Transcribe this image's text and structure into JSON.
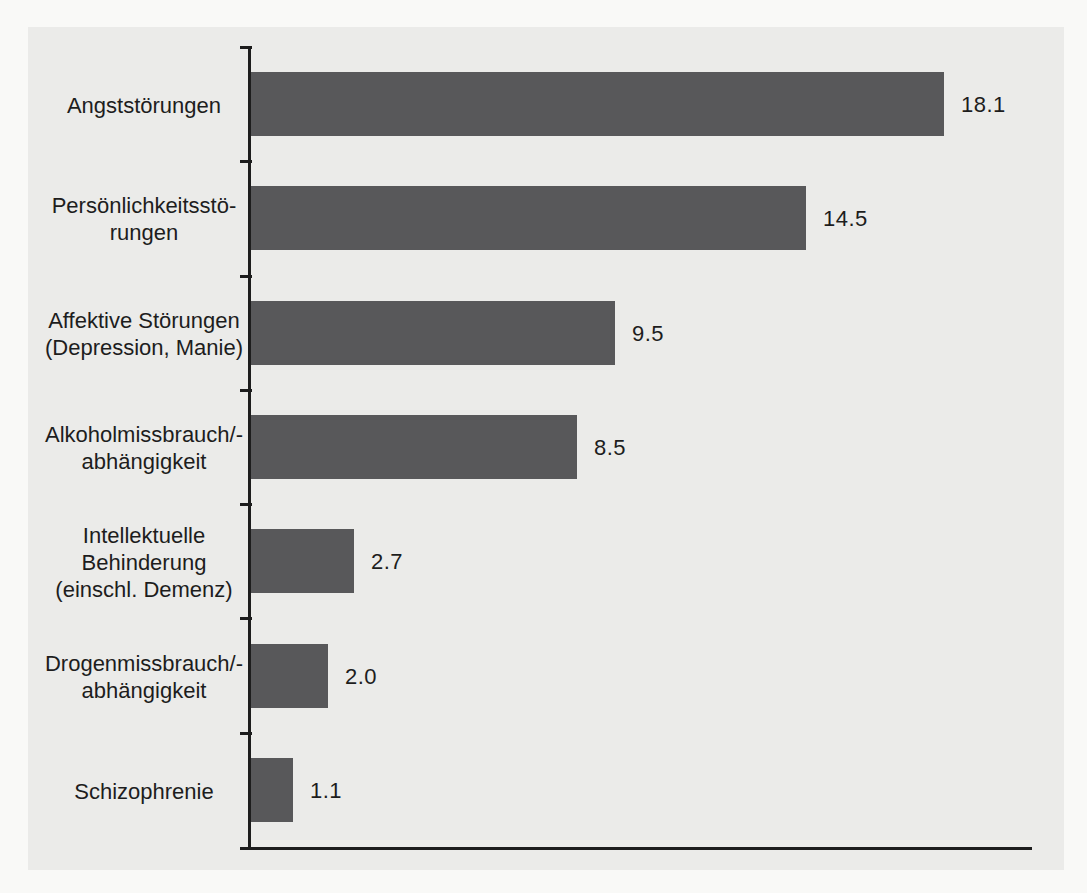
{
  "chart_data": {
    "type": "bar",
    "orientation": "horizontal",
    "title": "",
    "xlabel": "",
    "ylabel": "",
    "xlim": [
      0,
      20
    ],
    "grid": false,
    "legend": false,
    "categories": [
      "Angststörungen",
      "Persönlichkeitsstörungen",
      "Affektive Störungen (Depression, Manie)",
      "Alkoholmissbrauch/-abhängigkeit",
      "Intellektuelle Behinderung (einschl. Demenz)",
      "Drogenmissbrauch/-abhängigkeit",
      "Schizophrenie"
    ],
    "category_display_lines": [
      [
        "Angststörungen"
      ],
      [
        "Persönlichkeitsstö-",
        "rungen"
      ],
      [
        "Affektive Störungen",
        "(Depression, Manie)"
      ],
      [
        "Alkoholmissbrauch/-",
        "abhängigkeit"
      ],
      [
        "Intellektuelle",
        "Behinderung",
        "(einschl. Demenz)"
      ],
      [
        "Drogenmissbrauch/-",
        "abhängigkeit"
      ],
      [
        "Schizophrenie"
      ]
    ],
    "values": [
      18.1,
      14.5,
      9.5,
      8.5,
      2.7,
      2.0,
      1.1
    ],
    "value_labels": [
      "18.1",
      "14.5",
      "9.5",
      "8.5",
      "2.7",
      "2.0",
      "1.1"
    ],
    "colors": {
      "bar": "#58585a",
      "axis": "#1d1d1d",
      "text": "#1d1d1d",
      "plot_background": "#ebebe9",
      "page_background": "#f9f9f7"
    }
  }
}
